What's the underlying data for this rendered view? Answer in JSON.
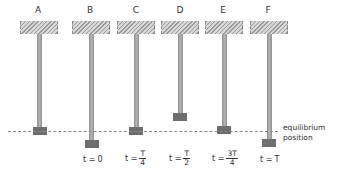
{
  "figure": {
    "columns": [
      {
        "label": "A",
        "time": null
      },
      {
        "label": "B",
        "time": {
          "prefix": "t = ",
          "value": "0"
        }
      },
      {
        "label": "C",
        "time": {
          "prefix": "t = ",
          "num": "T",
          "den": "4"
        }
      },
      {
        "label": "D",
        "time": {
          "prefix": "t = ",
          "num": "T",
          "den": "2"
        }
      },
      {
        "label": "E",
        "time": {
          "prefix": "t = ",
          "num": "3T",
          "den": "4"
        }
      },
      {
        "label": "F",
        "time": {
          "prefix": "t = ",
          "value": "T"
        }
      }
    ],
    "equilibrium_label_line1": "equilibrium",
    "equilibrium_label_line2": "position"
  }
}
